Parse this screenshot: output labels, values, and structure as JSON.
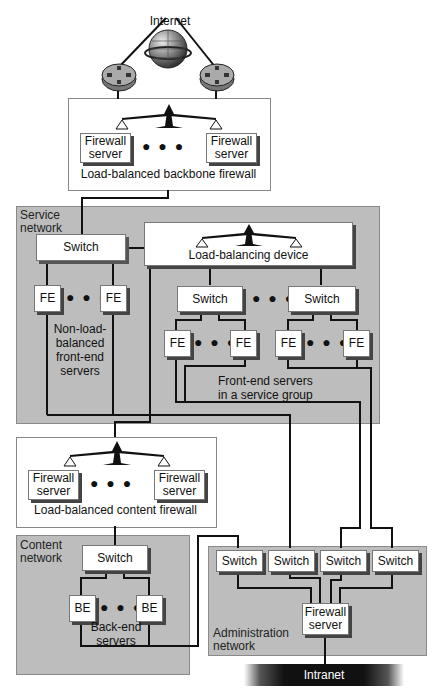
{
  "top": {
    "internet_label": "Internet",
    "backbone_firewall": {
      "server_left": "Firewall server",
      "server_right": "Firewall server",
      "caption": "Load-balanced backbone firewall"
    }
  },
  "service_network": {
    "label": "Service network",
    "switch_main": "Switch",
    "load_balancer": "Load-balancing device",
    "non_lb": {
      "fe_left": "FE",
      "fe_right": "FE",
      "caption": "Non-load-balanced front-end servers"
    },
    "group_switch_left": "Switch",
    "group_switch_right": "Switch",
    "group_fe": [
      "FE",
      "FE",
      "FE",
      "FE"
    ],
    "group_caption": "Front-end servers in a service group"
  },
  "content_firewall": {
    "server_left": "Firewall server",
    "server_right": "Firewall server",
    "caption": "Load-balanced content firewall"
  },
  "content_network": {
    "label": "Content network",
    "switch": "Switch",
    "be_left": "BE",
    "be_right": "BE",
    "caption": "Back-end servers"
  },
  "admin_network": {
    "label": "Administration network",
    "switches": [
      "Switch",
      "Switch",
      "Switch",
      "Switch"
    ],
    "firewall": "Firewall server"
  },
  "intranet_label": "Intranet",
  "dots": "● ● ●"
}
